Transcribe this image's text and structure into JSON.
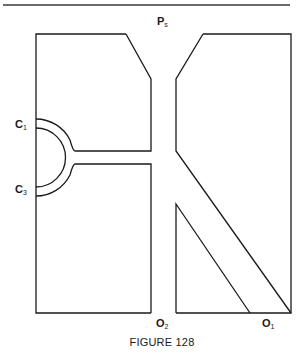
{
  "figure": {
    "caption": "FIGURE 128",
    "labels": {
      "supply": {
        "main": "P",
        "sub": "s"
      },
      "control_1": {
        "main": "C",
        "sub": "1"
      },
      "control_3": {
        "main": "C",
        "sub": "3"
      },
      "output_2": {
        "main": "O",
        "sub": "2"
      },
      "output_1": {
        "main": "O",
        "sub": "1"
      }
    },
    "stroke_color": "#1a1a1a",
    "rule_color": "#6a6a6a"
  }
}
